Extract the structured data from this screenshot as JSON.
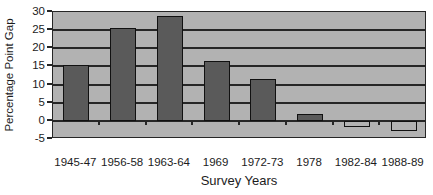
{
  "chart_data": {
    "type": "bar",
    "title": "",
    "xlabel": "Survey Years",
    "ylabel": "Percentage Point Gap",
    "categories": [
      "1945-47",
      "1956-58",
      "1963-64",
      "1969",
      "1972-73",
      "1978",
      "1982-84",
      "1988-89"
    ],
    "values": [
      15.3,
      25.5,
      29.0,
      16.5,
      11.5,
      1.8,
      -1.8,
      -2.8
    ],
    "ylim": [
      -5,
      30
    ],
    "y_ticks": [
      30,
      25,
      20,
      15,
      10,
      5,
      0,
      -5
    ],
    "y_tick_step": 5,
    "grid": true,
    "legend": false,
    "series_count": 1
  },
  "colors": {
    "page_bg": "#ffffff",
    "plot_bg": "#b2b2b2",
    "bar_fill": "#5a5a5a",
    "negative_bar_fill": "#b2b2b2",
    "bar_border": "#111111",
    "gridline": "#262626",
    "text": "#1c1c1c"
  }
}
